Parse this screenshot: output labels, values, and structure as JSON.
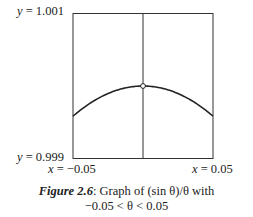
{
  "chart_data": {
    "type": "line",
    "title": "Graph of (sin θ)/θ with −0.05 < θ < 0.05",
    "xlabel": "θ",
    "ylabel": "y",
    "xlim": [
      -0.05,
      0.05
    ],
    "ylim": [
      0.999,
      1.001
    ],
    "grid": false,
    "series": [
      {
        "name": "(sin θ)/θ",
        "x": [
          -0.05,
          -0.04,
          -0.03,
          -0.02,
          -0.01,
          0,
          0.01,
          0.02,
          0.03,
          0.04,
          0.05
        ],
        "y": [
          0.999583,
          0.999733,
          0.99985,
          0.999933,
          0.999983,
          1.0,
          0.999983,
          0.999933,
          0.99985,
          0.999733,
          0.999583
        ]
      }
    ],
    "annotations": [
      {
        "text": "open circle at θ = 0 (undefined point)",
        "x": 0,
        "y": 1.0
      }
    ],
    "axis_labels": {
      "y_top": "y = 1.001",
      "y_bottom": "y = 0.999",
      "x_left": "x = −0.05",
      "x_right": "x = 0.05"
    }
  },
  "labels": {
    "y_top_var": "y",
    "y_top_val": " = 1.001",
    "y_bottom_var": "y",
    "y_bottom_val": " = 0.999",
    "x_left_var": "x",
    "x_left_val": " = −0.05",
    "x_right_var": "x",
    "x_right_val": " = 0.05"
  },
  "caption": {
    "figure_number": "Figure 2.6",
    "line1": ": Graph of (sin θ)/θ with",
    "line2": "−0.05 < θ < 0.05"
  }
}
